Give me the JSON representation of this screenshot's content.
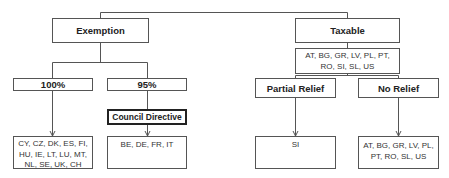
{
  "diagram": {
    "root_connector": "Exemption / Taxable",
    "exemption": {
      "label": "Exemption",
      "branches": [
        {
          "label": "100%",
          "countries": "CY, CZ, DK, ES, FI, HU, IE, LT, LU, MT, NL, SE, UK, CH"
        },
        {
          "label": "95%",
          "intermediate": "Council Directive",
          "countries": "BE, DE, FR, IT"
        }
      ]
    },
    "taxable": {
      "label": "Taxable",
      "countries": "AT, BG, GR, LV, PL, PT, RO, SI, SL, US",
      "branches": [
        {
          "label": "Partial Relief",
          "countries": "SI"
        },
        {
          "label": "No Relief",
          "countries": "AT, BG, GR, LV, PL, PT, RO, SL, US"
        }
      ]
    },
    "colors": {
      "line": "#555555",
      "border": "#555555",
      "text": "#222222"
    }
  }
}
